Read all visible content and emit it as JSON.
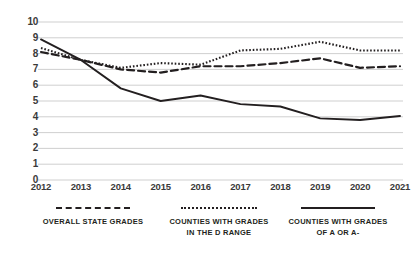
{
  "chart_data": {
    "type": "line",
    "title": "",
    "xlabel": "",
    "ylabel": "",
    "categories": [
      "2012",
      "2013",
      "2014",
      "2015",
      "2016",
      "2017",
      "2018",
      "2019",
      "2020",
      "2021"
    ],
    "x": [
      2012,
      2013,
      2014,
      2015,
      2016,
      2017,
      2018,
      2019,
      2020,
      2021
    ],
    "ylim": [
      0,
      10
    ],
    "xlim": [
      2012,
      2021
    ],
    "ytick_labels": [
      "10",
      "9",
      "8",
      "7",
      "6",
      "5",
      "4",
      "3",
      "2",
      "1",
      "0"
    ],
    "ytick_values": [
      10,
      9,
      8,
      7,
      6,
      5,
      4,
      3,
      2,
      1,
      0
    ],
    "grid": true,
    "grid_axis": "y",
    "legend_position": "bottom",
    "series": [
      {
        "name": "Overall state grades",
        "style": "dashed",
        "color": "#231f20",
        "values": [
          8.1,
          7.6,
          7.0,
          6.8,
          7.2,
          7.2,
          7.4,
          7.7,
          7.1,
          7.2
        ]
      },
      {
        "name": "Counties with grades in the D range",
        "style": "dotted",
        "color": "#231f20",
        "values": [
          8.35,
          7.6,
          7.1,
          7.4,
          7.3,
          8.2,
          8.3,
          8.75,
          8.2,
          8.2
        ]
      },
      {
        "name": "Counties with grades of A or A-",
        "style": "solid",
        "color": "#231f20",
        "values": [
          8.9,
          7.6,
          5.8,
          5.0,
          5.35,
          4.8,
          4.65,
          3.9,
          3.8,
          4.05
        ]
      }
    ]
  },
  "axes": {
    "y_ticks": [
      "10",
      "9",
      "8",
      "7",
      "6",
      "5",
      "4",
      "3",
      "2",
      "1",
      "0"
    ],
    "x_ticks": [
      "2012",
      "2013",
      "2014",
      "2015",
      "2016",
      "2017",
      "2018",
      "2019",
      "2020",
      "2021"
    ]
  },
  "legend": {
    "items": [
      {
        "label": "Overall state grades",
        "style": "dashed"
      },
      {
        "label": "Counties with grades\nin the D range",
        "style": "dotted"
      },
      {
        "label": "Counties with grades\nof A or A-",
        "style": "solid"
      }
    ]
  },
  "colors": {
    "ink": "#231f20",
    "grid": "#c9c9c9",
    "tick_text": "#3a3a3a",
    "background": "#ffffff"
  }
}
